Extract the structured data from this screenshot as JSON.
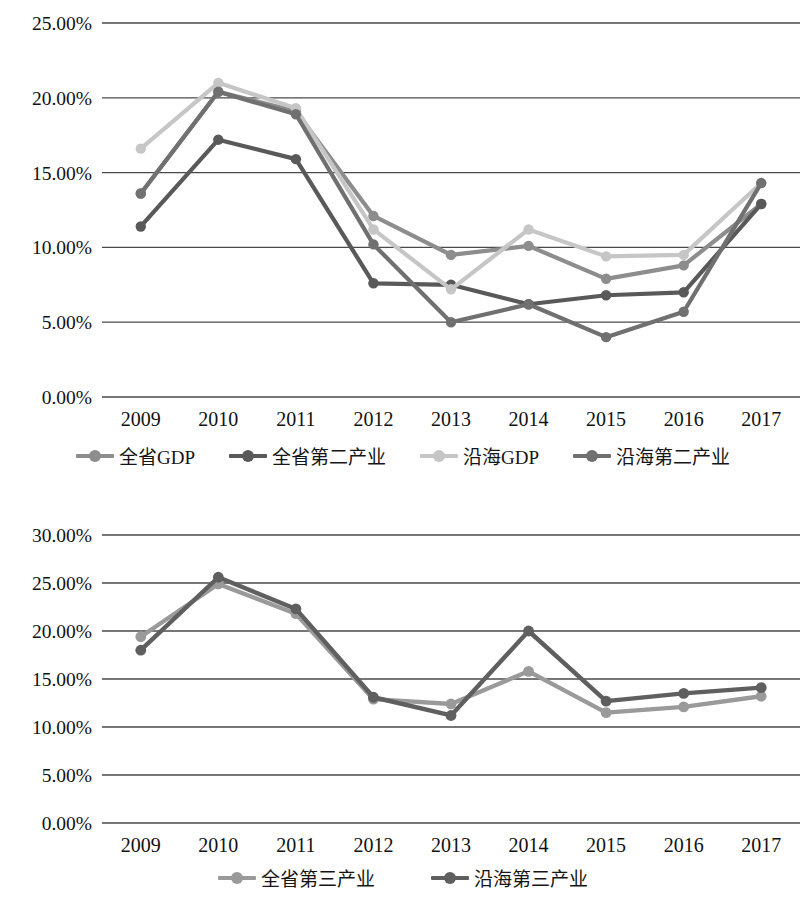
{
  "chart_data": [
    {
      "id": "chart-top",
      "type": "line",
      "title": "",
      "xlabel": "",
      "ylabel": "",
      "categories": [
        "2009",
        "2010",
        "2011",
        "2012",
        "2013",
        "2014",
        "2015",
        "2016",
        "2017"
      ],
      "ylim": [
        0,
        25
      ],
      "ytick_labels": [
        "0.00%",
        "5.00%",
        "10.00%",
        "15.00%",
        "20.00%",
        "25.00%"
      ],
      "ytick_values": [
        0,
        5,
        10,
        15,
        20,
        25
      ],
      "grid": true,
      "legend_position": "bottom",
      "series": [
        {
          "name": "全省GDP",
          "color": "#8d8d8d",
          "values": [
            13.6,
            20.4,
            19.1,
            12.1,
            9.5,
            10.1,
            7.9,
            8.8,
            12.9
          ]
        },
        {
          "name": "全省第二产业",
          "color": "#595959",
          "values": [
            11.4,
            17.2,
            15.9,
            7.6,
            7.5,
            6.2,
            6.8,
            7.0,
            12.9
          ]
        },
        {
          "name": "沿海GDP",
          "color": "#c6c6c6",
          "values": [
            16.6,
            21.0,
            19.3,
            11.2,
            7.2,
            11.2,
            9.4,
            9.5,
            14.3
          ]
        },
        {
          "name": "沿海第二产业",
          "color": "#707070",
          "values": [
            13.6,
            20.4,
            18.9,
            10.2,
            5.0,
            6.2,
            4.0,
            5.7,
            14.3
          ]
        }
      ]
    },
    {
      "id": "chart-bottom",
      "type": "line",
      "title": "",
      "xlabel": "",
      "ylabel": "",
      "categories": [
        "2009",
        "2010",
        "2011",
        "2012",
        "2013",
        "2014",
        "2015",
        "2016",
        "2017"
      ],
      "ylim": [
        0,
        30
      ],
      "ytick_labels": [
        "0.00%",
        "5.00%",
        "10.00%",
        "15.00%",
        "20.00%",
        "25.00%",
        "30.00%"
      ],
      "ytick_values": [
        0,
        5,
        10,
        15,
        20,
        25,
        30
      ],
      "grid": true,
      "legend_position": "bottom",
      "series": [
        {
          "name": "全省第三产业",
          "color": "#9a9a9a",
          "values": [
            19.4,
            24.9,
            21.8,
            12.9,
            12.4,
            15.8,
            11.5,
            12.1,
            13.2
          ]
        },
        {
          "name": "沿海第三产业",
          "color": "#5f5f5f",
          "values": [
            18.0,
            25.6,
            22.3,
            13.1,
            11.2,
            20.0,
            12.7,
            13.5,
            14.1
          ]
        }
      ]
    }
  ],
  "charts": [
    {
      "legend": [
        {
          "label": "全省GDP",
          "color": "#8d8d8d"
        },
        {
          "label": "全省第二产业",
          "color": "#595959"
        },
        {
          "label": "沿海GDP",
          "color": "#c6c6c6"
        },
        {
          "label": "沿海第二产业",
          "color": "#707070"
        }
      ]
    },
    {
      "legend": [
        {
          "label": "全省第三产业",
          "color": "#9a9a9a"
        },
        {
          "label": "沿海第三产业",
          "color": "#5f5f5f"
        }
      ]
    }
  ]
}
